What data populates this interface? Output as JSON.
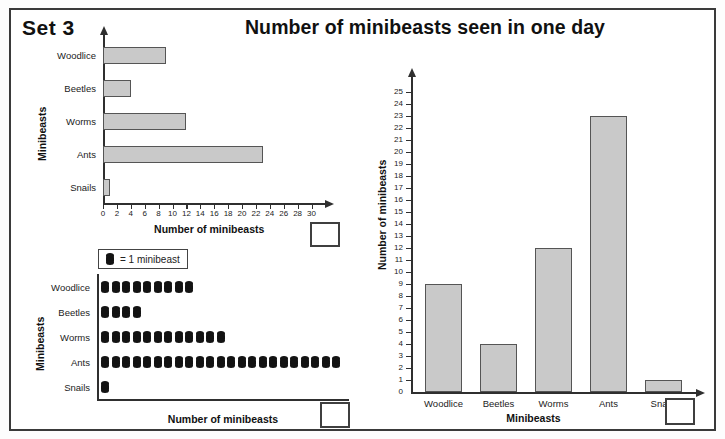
{
  "page": {
    "set_label": "Set 3",
    "title": "Number of minibeasts seen in one day"
  },
  "legend": {
    "symbol_name": "minibeast-symbol",
    "text": "= 1 minibeast"
  },
  "colors": {
    "bar_fill": "#c9c9c9",
    "bar_stroke": "#555555",
    "axis": "#2f2f2f",
    "symbol": "#131313",
    "frame": "#3a3a3a"
  },
  "answer_boxes": [
    {
      "name": "answer-box-hbar"
    },
    {
      "name": "answer-box-pictogram"
    },
    {
      "name": "answer-box-vbar"
    }
  ],
  "chart_data": [
    {
      "id": "horizontal-bar-chart",
      "type": "bar",
      "orientation": "horizontal",
      "title": "",
      "categories": [
        "Woodlice",
        "Beetles",
        "Worms",
        "Ants",
        "Snails"
      ],
      "values": [
        9,
        4,
        12,
        23,
        1
      ],
      "xlabel": "Number of minibeasts",
      "ylabel": "Minibeasts",
      "xlim": [
        0,
        32
      ],
      "xticks": [
        0,
        2,
        4,
        6,
        8,
        10,
        12,
        14,
        16,
        18,
        20,
        22,
        24,
        26,
        28,
        30
      ],
      "grid": false,
      "legend": "none"
    },
    {
      "id": "pictogram-chart",
      "type": "pictogram",
      "orientation": "horizontal",
      "title": "",
      "categories": [
        "Woodlice",
        "Beetles",
        "Worms",
        "Ants",
        "Snails"
      ],
      "values": [
        9,
        4,
        12,
        23,
        1
      ],
      "symbol_value": 1,
      "symbol_label": "= 1 minibeast",
      "xlabel": "Number of minibeasts",
      "ylabel": "Minibeasts",
      "grid": false,
      "legend": "top-center"
    },
    {
      "id": "vertical-bar-chart",
      "type": "bar",
      "orientation": "vertical",
      "title": "",
      "categories": [
        "Woodlice",
        "Beetles",
        "Worms",
        "Ants",
        "Snails"
      ],
      "values": [
        9,
        4,
        12,
        23,
        1
      ],
      "xlabel": "Minibeasts",
      "ylabel": "Number of minibeasts",
      "ylim": [
        0,
        25
      ],
      "yticks": [
        0,
        1,
        2,
        3,
        4,
        5,
        6,
        7,
        8,
        9,
        10,
        11,
        12,
        13,
        14,
        15,
        16,
        17,
        18,
        19,
        20,
        21,
        22,
        23,
        24,
        25
      ],
      "grid": false,
      "legend": "none"
    }
  ]
}
